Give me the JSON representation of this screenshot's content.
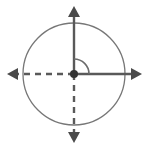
{
  "figure": {
    "width": 148,
    "height": 148,
    "background_color": "#ffffff"
  },
  "colors": {
    "circle_stroke": "#777777",
    "axis_solid": "#595959",
    "axis_dashed": "#595959",
    "arrowhead_fill": "#4a4a4a",
    "arc_stroke": "#6b6b6b",
    "origin_dot": "#333333"
  },
  "geometry": {
    "center_x": 74,
    "center_y": 74,
    "circle_radius": 51,
    "origin_dot_radius": 4,
    "arc_radius": 15,
    "arc_start_angle_deg": 0,
    "arc_end_angle_deg": 90,
    "axis_stroke_width": 2.4,
    "circle_stroke_width": 1.3,
    "arc_stroke_width": 1.6,
    "dash_pattern": "6 5"
  },
  "elements": {
    "circle": {
      "name": "circle",
      "style": "solid"
    },
    "x_axis_positive": {
      "name": "positive-x-axis",
      "style": "solid",
      "direction": "right",
      "arrow": "arrowhead-right",
      "end_x": 144
    },
    "x_axis_negative": {
      "name": "negative-x-axis",
      "style": "dashed",
      "direction": "left",
      "arrow": "arrowhead-left",
      "end_x": 5
    },
    "y_axis_positive": {
      "name": "positive-y-axis",
      "style": "solid",
      "direction": "up",
      "arrow": "arrowhead-up",
      "end_y": 5
    },
    "y_axis_negative": {
      "name": "negative-y-axis",
      "style": "dashed",
      "direction": "down",
      "arrow": "arrowhead-down",
      "end_y": 143
    },
    "angle_arc": {
      "name": "angle-arc",
      "measure_degrees": 90,
      "quadrant": 1
    },
    "origin": {
      "name": "origin-point"
    }
  },
  "labels": {
    "angle_text": "",
    "x_axis_text": "",
    "y_axis_text": "",
    "origin_text": ""
  }
}
